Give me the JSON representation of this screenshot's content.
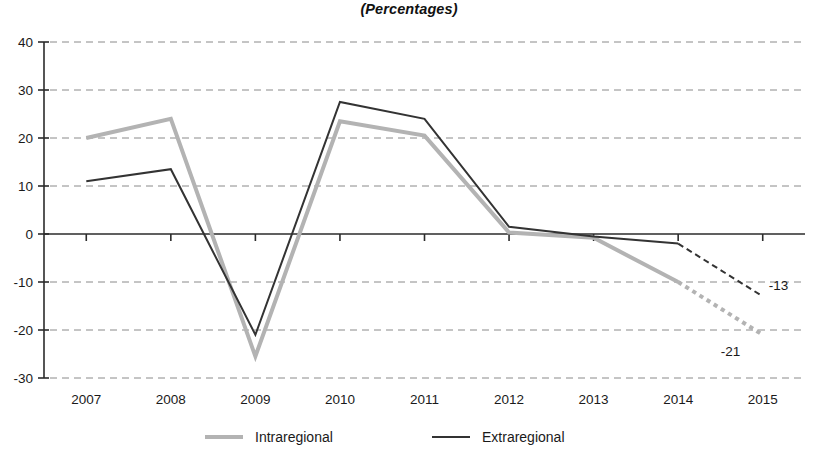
{
  "chart_data": {
    "type": "line",
    "title": "(Percentages)",
    "xlabel": "",
    "ylabel": "",
    "categories": [
      "2007",
      "2008",
      "2009",
      "2010",
      "2011",
      "2012",
      "2013",
      "2014",
      "2015"
    ],
    "ylim": [
      -30,
      40
    ],
    "yticks": [
      40,
      30,
      20,
      10,
      0,
      -10,
      -20,
      -30
    ],
    "ytick_labels": [
      "40",
      "30",
      "20",
      "10",
      "0",
      "-10",
      "-20",
      "-30"
    ],
    "grid": true,
    "grid_style": "dashed-horizontal",
    "legend_position": "bottom",
    "series": [
      {
        "name": "Intraregional",
        "color": "#b3b3b3",
        "line_width": 4,
        "values": [
          20,
          24,
          -25.5,
          23.5,
          20.5,
          0.3,
          -0.8,
          -10,
          -21
        ],
        "projected_from": "2014",
        "projected_style": "dotted",
        "end_label": "-21"
      },
      {
        "name": "Extraregional",
        "color": "#333333",
        "line_width": 2,
        "values": [
          11,
          13.5,
          -21,
          27.5,
          24,
          1.5,
          -0.5,
          -2,
          -13
        ],
        "projected_from": "2014",
        "projected_style": "dashed",
        "end_label": "-13"
      }
    ],
    "annotations": [
      {
        "text": "-13",
        "series": "Extraregional",
        "x": "2015",
        "y": -13
      },
      {
        "text": "-21",
        "series": "Intraregional",
        "x": "2015",
        "y": -21
      }
    ]
  },
  "legend": {
    "items": [
      {
        "label": "Intraregional",
        "swatch": "line-swatch-gray"
      },
      {
        "label": "Extraregional",
        "swatch": "line-swatch-dark"
      }
    ]
  }
}
